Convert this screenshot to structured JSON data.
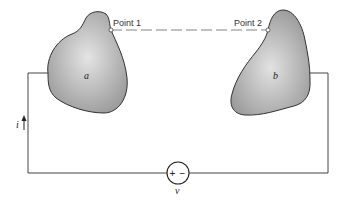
{
  "diagram": {
    "conductors": [
      {
        "id": "a",
        "label": "a"
      },
      {
        "id": "b",
        "label": "b"
      }
    ],
    "points": [
      {
        "id": "point1",
        "label": "Point 1"
      },
      {
        "id": "point2",
        "label": "Point 2"
      }
    ],
    "current_label": "i",
    "source": {
      "plus": "+",
      "minus": "−",
      "label": "v"
    },
    "colors": {
      "wire": "#444444",
      "conductor_fill_light": "#e6e6e6",
      "conductor_fill_dark": "#9a9a9a",
      "conductor_outline": "#333333"
    }
  }
}
